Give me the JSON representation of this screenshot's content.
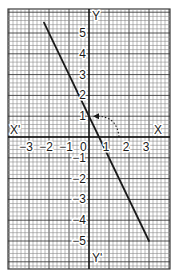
{
  "chart_data": {
    "type": "line",
    "title": "",
    "equation": "y = -2x + 1",
    "xlabel": "X",
    "xlabel_neg": "X'",
    "ylabel": "Y",
    "ylabel_neg": "Y'",
    "origin_label": "0",
    "xlim": [
      -4,
      4
    ],
    "ylim": [
      -6,
      6
    ],
    "grid": true,
    "grid_minor_per_unit": 5,
    "x_ticks": [
      {
        "value": -3,
        "label": "-3"
      },
      {
        "value": -2,
        "label": "-2"
      },
      {
        "value": -1,
        "label": "-1"
      },
      {
        "value": 1,
        "label": "1"
      },
      {
        "value": 2,
        "label": "2"
      },
      {
        "value": 3,
        "label": "3"
      }
    ],
    "y_ticks": [
      {
        "value": 5,
        "label": "5"
      },
      {
        "value": 4,
        "label": "4"
      },
      {
        "value": 3,
        "label": "3"
      },
      {
        "value": 2,
        "label": "2"
      },
      {
        "value": 1,
        "label": "1"
      },
      {
        "value": -1,
        "label": "-1"
      },
      {
        "value": -2,
        "label": "-2"
      },
      {
        "value": -3,
        "label": "-3"
      },
      {
        "value": -4,
        "label": "-4"
      },
      {
        "value": -5,
        "label": "-5"
      }
    ],
    "series": [
      {
        "name": "line",
        "points": [
          [
            -2.25,
            5.5
          ],
          [
            3,
            -5
          ]
        ],
        "color": "#1a1a1a"
      }
    ],
    "annotations": [
      {
        "type": "dotted-arc-arrow",
        "from": [
          1.5,
          0
        ],
        "to": [
          0.2,
          1
        ],
        "description": "dotted arc from x-axis to y-intercept (0,1)"
      }
    ]
  },
  "colors": {
    "grid_minor": "#8a8a8a",
    "grid_major": "#3a3a3a",
    "axis": "#111111",
    "line": "#1a1a1a",
    "background": "#ffffff"
  }
}
